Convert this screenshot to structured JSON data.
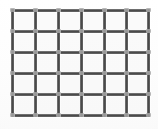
{
  "scene": {
    "kind": "welded-wire-mesh-panel",
    "alt_text": "Close-up of a rectangular welded wire mesh panel with square openings",
    "canvas": {
      "width": 158,
      "height": 129
    },
    "background_color": "#fefefe"
  },
  "mesh": {
    "label": "wire mesh grid",
    "columns": 6,
    "rows": 5,
    "cell_width_px": 22,
    "cell_height_px": 21,
    "wire_thickness_px": 3,
    "wire_color": "#4a4a4a",
    "wire_highlight_color": "#8d8d8d",
    "weld_nub_color": "#a8a8a8",
    "cell_fill_color": "#f6f6f6",
    "vertical_wire_count": 7,
    "horizontal_wire_count": 6,
    "vertical_wire_x": [
      11,
      34,
      57,
      80,
      103,
      125,
      147
    ],
    "horizontal_wire_y": [
      9,
      30,
      51,
      72,
      93,
      114
    ],
    "bounds": {
      "left": 11,
      "top": 9,
      "right": 147,
      "bottom": 114
    }
  }
}
